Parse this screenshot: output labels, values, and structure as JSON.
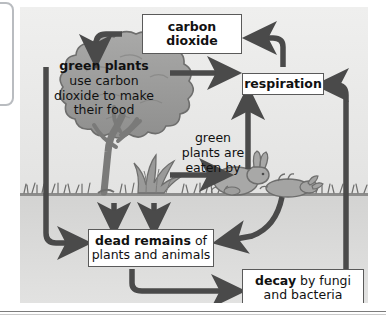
{
  "diagram": {
    "colors": {
      "arrow": "#4a4a4a",
      "box_border": "#5a5a5a",
      "box_fill": "#ffffff",
      "sky": "#ecececb",
      "soil": "#d3d3d2",
      "plant": "#9a9a99",
      "animal": "#aaaaa9"
    },
    "nodes": {
      "carbon_dioxide": {
        "line1": "carbon",
        "line2": "dioxide"
      },
      "respiration": {
        "label": "respiration"
      },
      "green_plants": {
        "heading": "green plants",
        "line1": "use carbon",
        "line2": "dioxide to make",
        "line3": "their food"
      },
      "eaten_by": {
        "line1": "green",
        "line2": "plants are",
        "line3": "eaten by"
      },
      "dead_remains": {
        "line1_bold": "dead remains",
        "line1_rest": " of",
        "line2": "plants and animals"
      },
      "decay": {
        "line1_bold": "decay",
        "line1_rest": " by fungi",
        "line2": "and bacteria"
      }
    },
    "art": {
      "tree": "tree-illustration",
      "shrub": "shrub-illustration",
      "rabbit_alive": "rabbit-illustration",
      "rabbit_dead": "dead-rabbit-illustration",
      "grass": "grass-illustration",
      "ground": "ground-line"
    },
    "arrows": [
      {
        "name": "co2-to-green-plants",
        "from": "carbon_dioxide",
        "to": "green_plants"
      },
      {
        "name": "green-plants-to-respiration",
        "from": "green_plants",
        "to": "respiration"
      },
      {
        "name": "respiration-to-co2",
        "from": "respiration",
        "to": "carbon_dioxide"
      },
      {
        "name": "green-plants-to-eaten-by",
        "from": "green_plants",
        "to": "rabbit"
      },
      {
        "name": "rabbit-to-respiration",
        "from": "rabbit",
        "to": "respiration"
      },
      {
        "name": "green-plants-to-dead-remains",
        "from": "green_plants",
        "to": "dead_remains"
      },
      {
        "name": "shrub-to-dead-remains",
        "from": "shrub",
        "to": "dead_remains"
      },
      {
        "name": "tree-to-dead-remains",
        "from": "tree",
        "to": "dead_remains"
      },
      {
        "name": "dead-rabbit-to-dead-remains",
        "from": "rabbit_dead",
        "to": "dead_remains"
      },
      {
        "name": "dead-remains-to-decay",
        "from": "dead_remains",
        "to": "decay"
      },
      {
        "name": "decay-to-respiration",
        "from": "decay",
        "to": "respiration"
      }
    ]
  }
}
